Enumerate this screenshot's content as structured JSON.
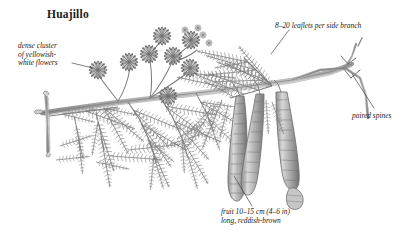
{
  "figure": {
    "title": "Huajillo",
    "ink_color": "#6e6e6e",
    "text_color": "#1a1a1a",
    "background": "#ffffff"
  },
  "labels": [
    {
      "id": "dense-cluster",
      "text": "dense cluster\nof yellowish-\nwhite flowers",
      "anchor": "flower-heads"
    },
    {
      "id": "leaflets",
      "text": "8–20 leaflets per side branch",
      "anchor": "pinnate-frond"
    },
    {
      "id": "paired-spines",
      "text": "paired spines",
      "anchor": "thorn-node"
    },
    {
      "id": "fruit",
      "text": "fruit 10–15 cm (4–6 in)\nlong, reddish-brown",
      "anchor": "seed-pod"
    }
  ],
  "parts": {
    "flower_heads": "spherical pom-pom flower clusters on slender stalks",
    "foliage": "bipinnate compound leaves with many fine leaflets",
    "pods": "three elongated constricted seed pods",
    "spines": "paired straight thorns at a branch node",
    "branch": "woody main stem"
  }
}
